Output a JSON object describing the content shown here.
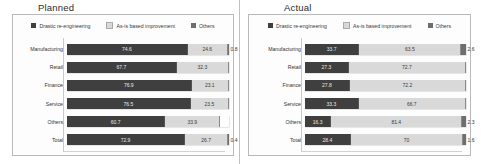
{
  "colors": {
    "drastic": "#3f3f3f",
    "asis": "#d9d9d9",
    "others": "#6e6e6e",
    "frame": "#b9b9b9",
    "text": "#333333"
  },
  "legend": {
    "items": [
      {
        "label": "Drastic re-engineering",
        "color": "#3f3f3f"
      },
      {
        "label": "As-is based improvement",
        "color": "#d9d9d9"
      },
      {
        "label": "Others",
        "color": "#6e6e6e"
      }
    ]
  },
  "panels": [
    {
      "title": "Planned"
    },
    {
      "title": "Actual"
    }
  ],
  "chart_data": [
    {
      "type": "bar",
      "title": "Planned",
      "orientation": "horizontal",
      "stacked": true,
      "stack_total": 100,
      "xlabel": "",
      "ylabel": "",
      "xlim": [
        0,
        100
      ],
      "grid": false,
      "legend_position": "top",
      "categories": [
        "Manufacturing",
        "Retail",
        "Finance",
        "Service",
        "Others",
        "Total"
      ],
      "series": [
        {
          "name": "Drastic re-engineering",
          "color": "#3f3f3f",
          "values": [
            74.6,
            67.7,
            76.9,
            76.5,
            60.7,
            72.9
          ]
        },
        {
          "name": "As-is based improvement",
          "color": "#d9d9d9",
          "values": [
            24.6,
            32.3,
            23.1,
            23.5,
            33.9,
            26.7
          ]
        },
        {
          "name": "Others",
          "color": "#6e6e6e",
          "values": [
            0.8,
            0.0,
            0.0,
            0.0,
            0.0,
            0.4
          ]
        }
      ],
      "labels": {
        "Drastic re-engineering": [
          "74.6",
          "67.7",
          "76.9",
          "76.5",
          "60.7",
          "72.9"
        ],
        "As-is based improvement": [
          "24.6",
          "32.3",
          "23.1",
          "23.5",
          "33.9",
          "26.7"
        ],
        "Others": [
          "0.8",
          "",
          "",
          "",
          "",
          "0.4"
        ]
      }
    },
    {
      "type": "bar",
      "title": "Actual",
      "orientation": "horizontal",
      "stacked": true,
      "stack_total": 100,
      "xlabel": "",
      "ylabel": "",
      "xlim": [
        0,
        100
      ],
      "grid": false,
      "legend_position": "top",
      "categories": [
        "Manufacturing",
        "Retail",
        "Finance",
        "Service",
        "Others",
        "Total"
      ],
      "series": [
        {
          "name": "Drastic re-engineering",
          "color": "#3f3f3f",
          "values": [
            33.7,
            27.3,
            27.8,
            33.3,
            16.3,
            28.4
          ]
        },
        {
          "name": "As-is based improvement",
          "color": "#d9d9d9",
          "values": [
            63.5,
            72.7,
            72.2,
            66.7,
            81.4,
            70.0
          ]
        },
        {
          "name": "Others",
          "color": "#6e6e6e",
          "values": [
            2.6,
            0.0,
            0.0,
            0.0,
            2.3,
            1.6
          ]
        }
      ],
      "labels": {
        "Drastic re-engineering": [
          "33.7",
          "27.3",
          "27.8",
          "33.3",
          "16.3",
          "28.4"
        ],
        "As-is based improvement": [
          "63.5",
          "72.7",
          "72.2",
          "66.7",
          "81.4",
          "70"
        ],
        "Others": [
          "2.6",
          "",
          "",
          "",
          "2.3",
          "1.6"
        ]
      }
    }
  ]
}
